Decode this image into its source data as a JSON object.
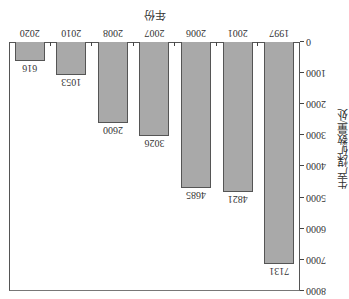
{
  "chart_data": {
    "type": "bar",
    "title": "",
    "xlabel": "年份",
    "ylabel": "生产煤矿数量/处",
    "categories": [
      "1997",
      "2001",
      "2006",
      "2007",
      "2008",
      "2010",
      "2020"
    ],
    "values": [
      7131,
      4821,
      4685,
      3026,
      2600,
      1053,
      616
    ],
    "value_labels": [
      "7131",
      "4821",
      "4685",
      "3026",
      "2600",
      "1053",
      "616"
    ],
    "ylim": [
      0,
      8000
    ],
    "yticks": [
      "0",
      "1000",
      "2000",
      "3000",
      "4000",
      "5000",
      "6000",
      "7000",
      "8000"
    ],
    "grid": false,
    "legend": null,
    "orientation_note": "image rendered rotated 180 degrees",
    "bar_color": "#a9a9a9"
  },
  "caption_partial": "图 … 生产煤矿数量变化"
}
